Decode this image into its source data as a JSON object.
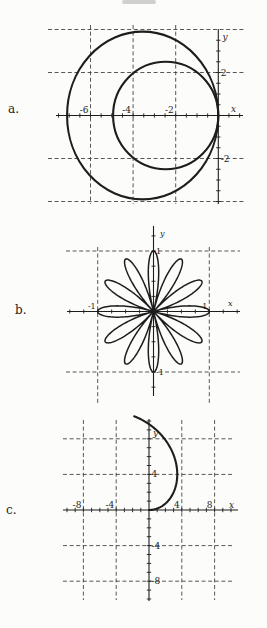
{
  "figure": {
    "background": "#fcfcfa",
    "ink_color": "#1d1d1d",
    "grid_color": "#3a3a3a",
    "grid_style": "dashed"
  },
  "chart_data": [
    {
      "panel_label": "a.",
      "type": "line",
      "subtype": "polar-circles",
      "title": "",
      "xlabel": "x",
      "ylabel": "y",
      "xlim": [
        -7.6,
        1.2
      ],
      "ylim": [
        -4.3,
        4.2
      ],
      "grid_x": [
        -6,
        -4,
        -2
      ],
      "grid_y": [
        4,
        2,
        -2,
        -4
      ],
      "x_tick_labels": [
        {
          "v": -6,
          "t": "-6"
        },
        {
          "v": -4,
          "t": "-4"
        },
        {
          "v": -2,
          "t": "-2"
        }
      ],
      "y_tick_labels": [
        {
          "v": 2,
          "t": "2"
        },
        {
          "v": -2,
          "t": "-2"
        }
      ],
      "minor_tick_step": 0.5,
      "legend": null,
      "curves": [
        {
          "kind": "ellipse",
          "desc": "outer circle through origin, diameter 7 on negative x-axis",
          "cx": -3.55,
          "cy": 0,
          "rx": 3.55,
          "ry": 3.9
        },
        {
          "kind": "ellipse",
          "desc": "inner circle through origin, diameter 5 on negative x-axis",
          "cx": -2.47,
          "cy": 0,
          "rx": 2.47,
          "ry": 2.5
        }
      ]
    },
    {
      "panel_label": "b.",
      "type": "line",
      "subtype": "polar-rose",
      "title": "",
      "xlabel": "x",
      "ylabel": "y",
      "xlim": [
        -1.55,
        1.55
      ],
      "ylim": [
        -1.4,
        1.45
      ],
      "grid_x": [
        -1,
        1
      ],
      "grid_y": [
        1,
        -1
      ],
      "x_tick_labels": [
        {
          "v": -1,
          "t": "-1"
        },
        {
          "v": 1,
          "t": "1"
        }
      ],
      "y_tick_labels": [
        {
          "v": 1,
          "t": "1"
        },
        {
          "v": -1,
          "t": "-1"
        }
      ],
      "minor_tick_step": 0.25,
      "legend": null,
      "curves": [
        {
          "kind": "rose",
          "desc": "12-petal rose r = cos(6θ), petal length 1",
          "a": 1,
          "k": 6
        }
      ]
    },
    {
      "panel_label": "c.",
      "type": "line",
      "subtype": "polar-spiral",
      "title": "",
      "xlabel": "x",
      "ylabel": "y",
      "xlim": [
        -10.5,
        10.9
      ],
      "ylim": [
        -10.2,
        10.2
      ],
      "grid_x": [
        -8,
        -4,
        4,
        8
      ],
      "grid_y": [
        8,
        4,
        -4,
        -8
      ],
      "x_tick_labels": [
        {
          "v": -8,
          "t": "-8"
        },
        {
          "v": -4,
          "t": "-4"
        },
        {
          "v": 4,
          "t": "4"
        },
        {
          "v": 8,
          "t": "8"
        }
      ],
      "y_tick_labels": [
        {
          "v": 4,
          "t": "4"
        },
        {
          "v": -4,
          "t": "-4"
        },
        {
          "v": -8,
          "t": "-8"
        }
      ],
      "minor_tick_step": 1,
      "legend": null,
      "curves": [
        {
          "kind": "spiral",
          "desc": "spiral arc r = 6.14θ from origin to θ ≈ 100°",
          "b": 6.14,
          "theta_range": [
            0,
            1.75
          ]
        }
      ]
    }
  ]
}
